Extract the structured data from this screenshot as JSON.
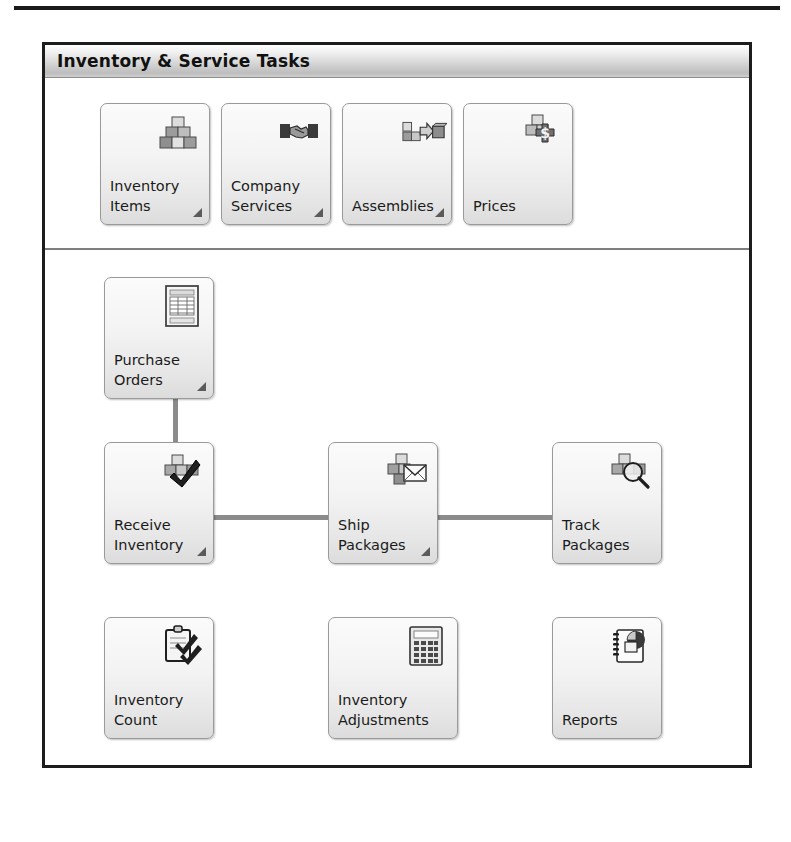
{
  "panel": {
    "title": "Inventory & Service Tasks"
  },
  "top_section": {
    "buttons": [
      {
        "label": "Inventory\nItems",
        "line1": "Inventory",
        "line2": "Items",
        "icon": "boxes-stack-icon",
        "has_dropdown": true
      },
      {
        "label": "Company\nServices",
        "line1": "Company",
        "line2": "Services",
        "icon": "handshake-icon",
        "has_dropdown": true
      },
      {
        "label": "Assemblies",
        "line1": "Assemblies",
        "line2": "",
        "icon": "assemblies-arrow-icon",
        "has_dropdown": true
      },
      {
        "label": "Prices",
        "line1": "Prices",
        "line2": "",
        "icon": "boxes-dollar-icon",
        "has_dropdown": false
      }
    ]
  },
  "flow_section": {
    "buttons": [
      {
        "label": "Purchase\nOrders",
        "line1": "Purchase",
        "line2": "Orders",
        "icon": "purchase-order-document-icon",
        "has_dropdown": true
      },
      {
        "label": "Receive\nInventory",
        "line1": "Receive",
        "line2": "Inventory",
        "icon": "boxes-check-icon",
        "has_dropdown": true
      },
      {
        "label": "Ship\nPackages",
        "line1": "Ship",
        "line2": "Packages",
        "icon": "boxes-envelope-icon",
        "has_dropdown": true
      },
      {
        "label": "Track\nPackages",
        "line1": "Track",
        "line2": "Packages",
        "icon": "boxes-magnifier-icon",
        "has_dropdown": false
      },
      {
        "label": "Inventory\nCount",
        "line1": "Inventory",
        "line2": "Count",
        "icon": "clipboard-check-icon",
        "has_dropdown": false
      },
      {
        "label": "Inventory\nAdjustments",
        "line1": "Inventory",
        "line2": "Adjustments",
        "icon": "calculator-icon",
        "has_dropdown": false
      },
      {
        "label": "Reports",
        "line1": "Reports",
        "line2": "",
        "icon": "report-piechart-icon",
        "has_dropdown": false
      }
    ]
  },
  "colors": {
    "panel_border": "#1c1c1c",
    "button_face": "#f1f1f1",
    "button_border": "#9a9a9a",
    "connector": "#8b8b8b",
    "text": "#1a1a1a"
  }
}
